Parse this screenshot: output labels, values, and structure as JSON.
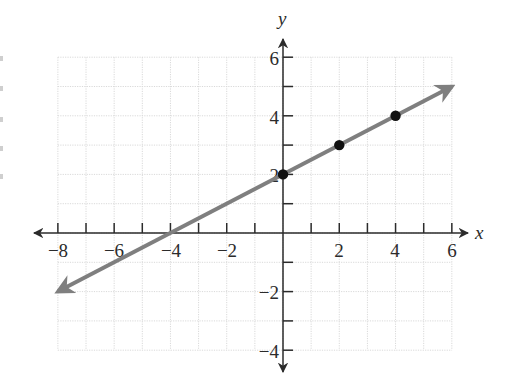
{
  "chart_data": {
    "type": "line",
    "title": "",
    "xlabel": "x",
    "ylabel": "y",
    "xlim": [
      -8,
      6
    ],
    "ylim": [
      -4,
      6
    ],
    "grid": true,
    "grid_step": 1,
    "x_tick_labels": [
      "-8",
      "-6",
      "-4",
      "-2",
      "2",
      "4",
      "6"
    ],
    "x_tick_values": [
      -8,
      -6,
      -4,
      -2,
      2,
      4,
      6
    ],
    "y_tick_labels": [
      "-4",
      "-2",
      "2",
      "4",
      "6"
    ],
    "y_tick_values": [
      -4,
      -2,
      2,
      4,
      6
    ],
    "series": [
      {
        "name": "y = 0.5x + 2",
        "kind": "line-with-arrows",
        "equation": "y = 0.5x + 2",
        "slope": 0.5,
        "intercept": 2,
        "x": [
          -8,
          6
        ],
        "y": [
          -2,
          5
        ],
        "color": "#7f7f7f"
      },
      {
        "name": "plotted points",
        "kind": "scatter",
        "x": [
          0,
          2,
          4
        ],
        "y": [
          2,
          3,
          4
        ],
        "color": "#111111"
      }
    ],
    "x_intercept": -4,
    "y_intercept": 2
  },
  "labels": {
    "x_axis": "x",
    "y_axis": "y",
    "x_ticks": [
      "−8",
      "−6",
      "−4",
      "−2",
      "2",
      "4",
      "6"
    ],
    "y_ticks": [
      "−4",
      "−2",
      "2",
      "4",
      "6"
    ]
  },
  "colors": {
    "line": "#7f7f7f",
    "points": "#111111",
    "axes": "#2b2b2b",
    "grid": "#d9d9d9"
  }
}
